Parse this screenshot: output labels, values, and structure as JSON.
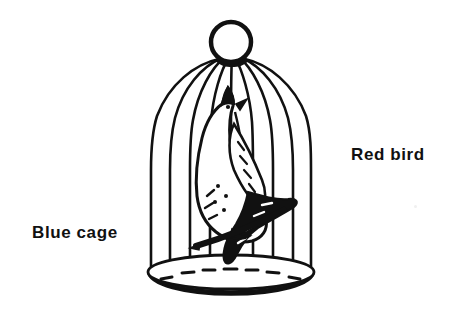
{
  "figure": {
    "background_color": "#ffffff",
    "ink_color": "#111111",
    "width": 459,
    "height": 324
  },
  "labels": {
    "left": {
      "text": "Blue cage",
      "refers_to": "cage",
      "x": 32,
      "y": 224,
      "color": "#111111",
      "weight": "bold"
    },
    "right": {
      "text": "Red bird",
      "refers_to": "bird",
      "x": 351,
      "y": 146,
      "color": "#111111",
      "weight": "bold"
    }
  },
  "drawing": {
    "cage": {
      "name": "birdcage",
      "finial": {
        "shape": "circle",
        "cx": 231,
        "cy": 42,
        "r": 21
      },
      "bar_count": 9,
      "body_left_x": 151,
      "body_right_x": 311,
      "dome_top_y": 62,
      "base_top_y": 266,
      "base_bottom_y": 290,
      "base_ellipse": {
        "cx": 231,
        "cy": 272,
        "rx": 83,
        "ry": 17
      },
      "floor_dash_count": 7
    },
    "bird": {
      "name": "perched-bird",
      "facing": "upper-left",
      "features": [
        "crest",
        "eye",
        "beak",
        "wing",
        "tail",
        "claws"
      ],
      "perch": {
        "type": "diagonal-bar",
        "x1": 196,
        "y1": 243,
        "x2": 296,
        "y2": 200
      }
    }
  }
}
